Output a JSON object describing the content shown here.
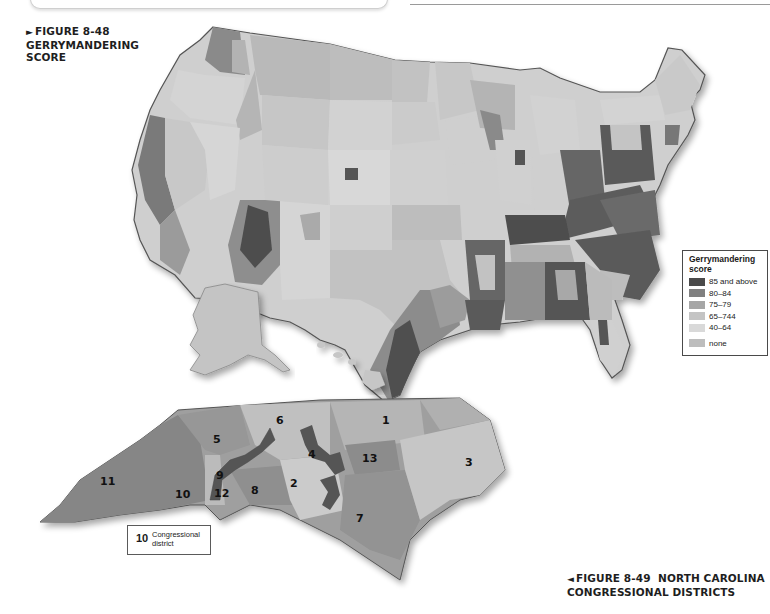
{
  "page": {
    "figure_48": {
      "marker": "►",
      "number": "FIGURE 8-48",
      "title_line1": "GERRYMANDERING",
      "title_line2": "SCORE"
    },
    "figure_49": {
      "marker": "◄",
      "number": "FIGURE 8-49",
      "title_line1": "NORTH CAROLINA",
      "title_line2": "CONGRESSIONAL DISTRICTS"
    }
  },
  "us_map": {
    "legend": {
      "title_line1": "Gerrymandering",
      "title_line2": "score",
      "items": [
        {
          "label": "85 and above",
          "color": "#4a4a4a"
        },
        {
          "label": "80–84",
          "color": "#808080"
        },
        {
          "label": "75–79",
          "color": "#a6a6a6"
        },
        {
          "label": "65–744",
          "color": "#c4c4c4"
        },
        {
          "label": "40–64",
          "color": "#d9d9d9"
        },
        {
          "label": "none",
          "color": "#bdbdbd"
        }
      ]
    },
    "colors": {
      "outline": "#555555",
      "state_border": "#f4f4f4",
      "shadow": "#d8d8d8"
    }
  },
  "nc_map": {
    "legend": {
      "sample_number": "10",
      "label_line1": "Congressional",
      "label_line2": "district"
    },
    "districts": [
      {
        "id": "1",
        "x": 386,
        "y": 418
      },
      {
        "id": "2",
        "x": 294,
        "y": 482
      },
      {
        "id": "3",
        "x": 468,
        "y": 455
      },
      {
        "id": "4",
        "x": 311,
        "y": 451
      },
      {
        "id": "5",
        "x": 213,
        "y": 436
      },
      {
        "id": "6",
        "x": 279,
        "y": 417
      },
      {
        "id": "7",
        "x": 354,
        "y": 516
      },
      {
        "id": "8",
        "x": 253,
        "y": 485
      },
      {
        "id": "9",
        "x": 215,
        "y": 472
      },
      {
        "id": "10",
        "x": 175,
        "y": 490
      },
      {
        "id": "11",
        "x": 94,
        "y": 477
      },
      {
        "id": "12",
        "x": 213,
        "y": 490
      },
      {
        "id": "13",
        "x": 362,
        "y": 454
      }
    ]
  }
}
